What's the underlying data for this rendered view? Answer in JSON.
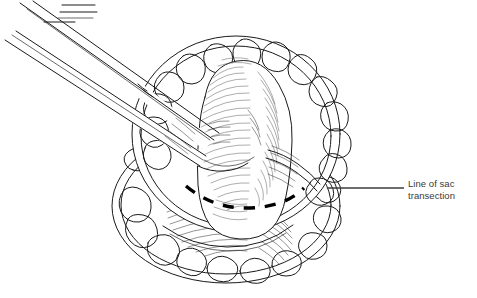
{
  "figure": {
    "background_color": "#ffffff",
    "ink_color": "#1a1a1a",
    "dash_color": "#000000",
    "label_color": "#3a3a3a"
  },
  "annotations": [
    {
      "id": "line-of-sac-transection",
      "text": "Line of sac\ntransection",
      "line_1": "Line of sac",
      "line_2": "transection",
      "leader_from_x": 328,
      "leader_from_y": 188,
      "leader_to_x": 404,
      "leader_to_y": 188
    }
  ],
  "structures": {
    "instrument": {
      "name": "forceps",
      "description": "long grasping forceps entering from upper left"
    },
    "upper_lobe": {
      "name": "upper-tissue-lobe",
      "description": "large rounded lobe with lobulated fatty rim"
    },
    "lower_lobe": {
      "name": "lower-tissue-lobe",
      "description": "smaller rounded lobe with lobulated fatty rim"
    },
    "sac": {
      "name": "hernia-sac",
      "description": "central hatched sac grasped by forceps"
    },
    "transection_marker": {
      "name": "dashed-transection-arc",
      "description": "curved dashed line across the sac"
    }
  }
}
